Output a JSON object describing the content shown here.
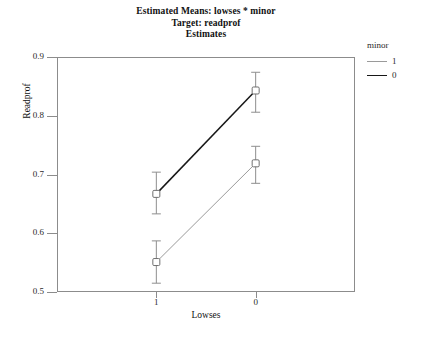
{
  "chart_data": {
    "type": "line",
    "title": "Estimated Means: lowses * minor",
    "subtitle": "Target: readprof",
    "subtitle2": "Estimates",
    "xlabel": "Lowses",
    "ylabel": "Readprof",
    "categories": [
      "1",
      "0"
    ],
    "ylim": [
      0.5,
      0.9
    ],
    "yticks": [
      "0.5",
      "0.6",
      "0.7",
      "0.8",
      "0.9"
    ],
    "ytick_values": [
      0.5,
      0.6,
      0.7,
      0.8,
      0.9
    ],
    "grid": false,
    "legend_position": "right",
    "legend_title": "minor",
    "error_bars": true,
    "series": [
      {
        "name": "1",
        "color": "#9a9a9a",
        "values": [
          0.551,
          0.719
        ],
        "ci_lower": [
          0.515,
          0.685
        ],
        "ci_upper": [
          0.587,
          0.748
        ]
      },
      {
        "name": "0",
        "color": "#171717",
        "values": [
          0.667,
          0.843
        ],
        "ci_lower": [
          0.633,
          0.806
        ],
        "ci_upper": [
          0.704,
          0.874
        ]
      }
    ]
  },
  "axes": {
    "frame_color": "#8c8c8c",
    "tick_color": "#8c8c8c"
  }
}
